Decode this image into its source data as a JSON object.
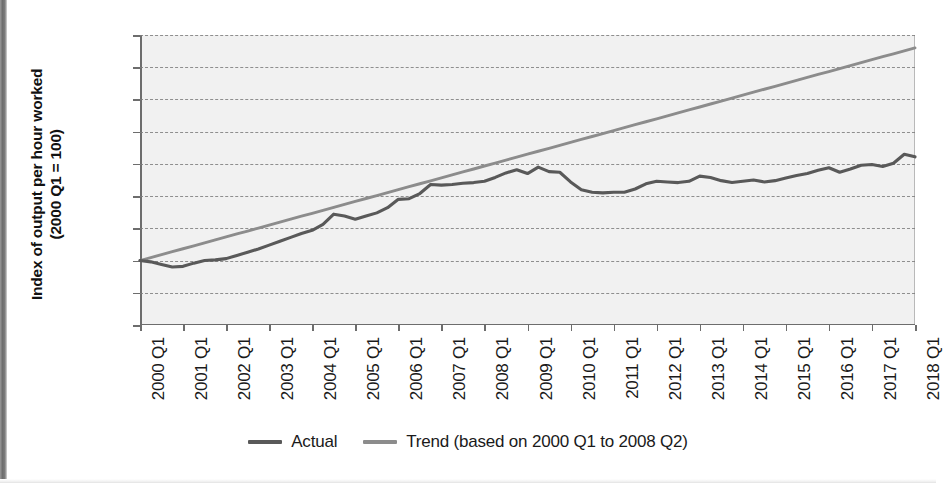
{
  "figure": {
    "y_axis_title_line1": "Index of output per hour worked",
    "y_axis_title_line2": "(2000 Q1 = 100)"
  },
  "legend": {
    "position": "bottom-center",
    "items": [
      {
        "label": "Actual",
        "color": "#595959"
      },
      {
        "label": "Trend (based on 2000 Q1 to 2008 Q2)",
        "color": "#8c8c8c"
      }
    ]
  },
  "chart_data": {
    "type": "line",
    "title": "",
    "xlabel": "",
    "ylabel": "Index of output per hour worked (2000 Q1 = 100)",
    "ylim": [
      90,
      135
    ],
    "yticks": [
      90,
      95,
      100,
      105,
      110,
      115,
      120,
      125,
      130,
      135
    ],
    "grid": true,
    "grid_style": "dashed-horizontal",
    "xtick_labels": [
      "2000 Q1",
      "2001 Q1",
      "2002 Q1",
      "2003 Q1",
      "2004 Q1",
      "2005 Q1",
      "2006 Q1",
      "2007 Q1",
      "2008 Q1",
      "2009 Q1",
      "2010 Q1",
      "2011 Q1",
      "2012 Q1",
      "2013 Q1",
      "2014 Q1",
      "2015 Q1",
      "2016 Q1",
      "2017 Q1",
      "2018 Q1"
    ],
    "x_quarters": [
      "2000 Q1",
      "2000 Q2",
      "2000 Q3",
      "2000 Q4",
      "2001 Q1",
      "2001 Q2",
      "2001 Q3",
      "2001 Q4",
      "2002 Q1",
      "2002 Q2",
      "2002 Q3",
      "2002 Q4",
      "2003 Q1",
      "2003 Q2",
      "2003 Q3",
      "2003 Q4",
      "2004 Q1",
      "2004 Q2",
      "2004 Q3",
      "2004 Q4",
      "2005 Q1",
      "2005 Q2",
      "2005 Q3",
      "2005 Q4",
      "2006 Q1",
      "2006 Q2",
      "2006 Q3",
      "2006 Q4",
      "2007 Q1",
      "2007 Q2",
      "2007 Q3",
      "2007 Q4",
      "2008 Q1",
      "2008 Q2",
      "2008 Q3",
      "2008 Q4",
      "2009 Q1",
      "2009 Q2",
      "2009 Q3",
      "2009 Q4",
      "2010 Q1",
      "2010 Q2",
      "2010 Q3",
      "2010 Q4",
      "2011 Q1",
      "2011 Q2",
      "2011 Q3",
      "2011 Q4",
      "2012 Q1",
      "2012 Q2",
      "2012 Q3",
      "2012 Q4",
      "2013 Q1",
      "2013 Q2",
      "2013 Q3",
      "2013 Q4",
      "2014 Q1",
      "2014 Q2",
      "2014 Q3",
      "2014 Q4",
      "2015 Q1",
      "2015 Q2",
      "2015 Q3",
      "2015 Q4",
      "2016 Q1",
      "2016 Q2",
      "2016 Q3",
      "2016 Q4",
      "2017 Q1",
      "2017 Q2",
      "2017 Q3",
      "2017 Q4",
      "2018 Q1"
    ],
    "series": [
      {
        "name": "Actual",
        "color": "#595959",
        "values": [
          100.0,
          99.8,
          99.4,
          99.0,
          99.1,
          99.6,
          100.0,
          100.1,
          100.3,
          100.8,
          101.3,
          101.8,
          102.4,
          103.0,
          103.6,
          104.2,
          104.7,
          105.6,
          107.2,
          106.9,
          106.4,
          106.9,
          107.4,
          108.2,
          109.5,
          109.6,
          110.4,
          111.8,
          111.7,
          111.8,
          112.0,
          112.1,
          112.3,
          112.9,
          113.6,
          114.1,
          113.5,
          114.5,
          113.8,
          113.7,
          112.2,
          111.0,
          110.6,
          110.5,
          110.6,
          110.6,
          111.1,
          111.9,
          112.3,
          112.2,
          112.1,
          112.3,
          113.1,
          112.9,
          112.4,
          112.1,
          112.3,
          112.5,
          112.2,
          112.4,
          112.8,
          113.2,
          113.5,
          114.0,
          114.4,
          113.7,
          114.2,
          114.8,
          114.9,
          114.6,
          115.1,
          116.5,
          116.1
        ]
      },
      {
        "name": "Trend (based on 2000 Q1 to 2008 Q2)",
        "color": "#8c8c8c",
        "note": "Linear trend fitted over 2000 Q1 to 2008 Q2, extrapolated to 2018 Q1",
        "values": [
          100.0,
          100.46,
          100.92,
          101.38,
          101.83,
          102.29,
          102.75,
          103.21,
          103.67,
          104.13,
          104.58,
          105.04,
          105.5,
          105.96,
          106.42,
          106.88,
          107.33,
          107.79,
          108.25,
          108.71,
          109.17,
          109.63,
          110.08,
          110.54,
          111.0,
          111.46,
          111.92,
          112.38,
          112.83,
          113.29,
          113.75,
          114.21,
          114.67,
          115.13,
          115.58,
          116.04,
          116.5,
          116.96,
          117.42,
          117.88,
          118.33,
          118.79,
          119.25,
          119.71,
          120.17,
          120.63,
          121.08,
          121.54,
          122.0,
          122.46,
          122.92,
          123.38,
          123.83,
          124.29,
          124.75,
          125.21,
          125.67,
          126.13,
          126.58,
          127.04,
          127.5,
          127.96,
          128.42,
          128.88,
          129.33,
          129.79,
          130.25,
          130.71,
          131.17,
          131.63,
          132.08,
          132.54,
          133.0
        ]
      }
    ]
  }
}
